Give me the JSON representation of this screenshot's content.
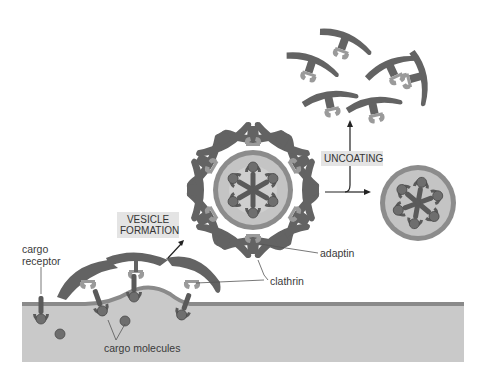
{
  "figure": {
    "colors": {
      "background": "#ffffff",
      "cytosol_fill": "#c9c9c9",
      "membrane": "#8a8a8a",
      "clathrin": "#636363",
      "adaptin": "#9a9a9a",
      "receptor": "#5a5a5a",
      "cargo": "#6e6e6e",
      "vesicle_lumen": "#c4c4c4",
      "label_box": "#e4e4e4"
    },
    "stages": [
      {
        "id": "budding",
        "label": "VESICLE FORMATION"
      },
      {
        "id": "coated-vesicle"
      },
      {
        "id": "uncoating",
        "label": "UNCOATING"
      },
      {
        "id": "naked-vesicle"
      },
      {
        "id": "free-clathrin"
      }
    ],
    "labels": {
      "vesicle_formation_line1": "VESICLE",
      "vesicle_formation_line2": "FORMATION",
      "uncoating": "UNCOATING",
      "adaptin": "adaptin",
      "clathrin": "clathrin",
      "cargo_receptor_line1": "cargo",
      "cargo_receptor_line2": "receptor",
      "cargo_molecules": "cargo molecules"
    }
  }
}
